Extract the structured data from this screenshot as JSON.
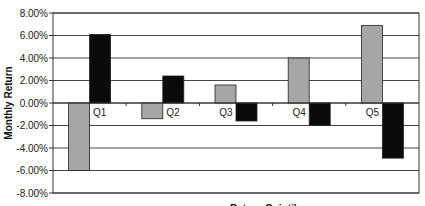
{
  "chart_data": {
    "type": "bar",
    "title": "",
    "xlabel": "Return Quintile",
    "ylabel": "Monthly Return",
    "categories": [
      "Q1",
      "Q2",
      "Q3",
      "Q4",
      "Q5"
    ],
    "series": [
      {
        "name": "Series 1",
        "color": "#a6a6a6",
        "values": [
          -6.0,
          -1.4,
          1.6,
          4.0,
          6.9
        ]
      },
      {
        "name": "Series 2",
        "color": "#0a0a0a",
        "values": [
          6.1,
          2.4,
          -1.6,
          -2.0,
          -4.9
        ]
      }
    ],
    "ylim": [
      -8,
      8
    ],
    "yticks": [
      8,
      6,
      4,
      2,
      0,
      -2,
      -4,
      -6,
      -8
    ],
    "ytick_labels": [
      "8.00%",
      "6.00%",
      "4.00%",
      "2.00%",
      "0.00%",
      "-2.00%",
      "-4.00%",
      "-6.00%",
      "-8.00%"
    ],
    "grid": true,
    "legend": "none",
    "value_format": "percent"
  }
}
